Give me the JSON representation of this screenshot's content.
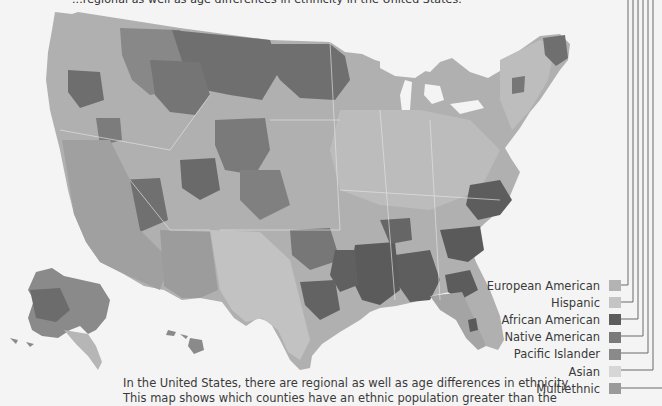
{
  "captions": {
    "top": "...regional as well as age differences in ethnicity in the United States.",
    "bottom_line1": "In the United States, there are regional as well as age differences in ethnicity.",
    "bottom_line2": "This map shows which counties have an ethnic population greater than the"
  },
  "map": {
    "type": "choropleth",
    "region": "United States (counties)",
    "base_color": "#a9a9a9",
    "background_color": "#f4f4f4"
  },
  "legend": {
    "items": [
      {
        "label": "European American",
        "color": "#b3b3b3"
      },
      {
        "label": "Hispanic",
        "color": "#c4c4c4"
      },
      {
        "label": "African American",
        "color": "#5c5c5c"
      },
      {
        "label": "Native American",
        "color": "#7a7a7a"
      },
      {
        "label": "Pacific Islander",
        "color": "#8a8a8a"
      },
      {
        "label": "Asian",
        "color": "#d6d6d6"
      },
      {
        "label": "Multiethnic",
        "color": "#9a9a9a"
      }
    ]
  }
}
